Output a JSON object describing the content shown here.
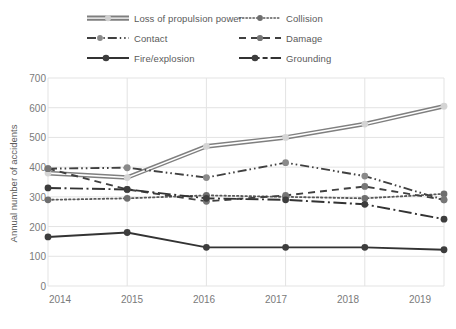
{
  "chart_data": {
    "type": "line",
    "title": "",
    "xlabel": "",
    "ylabel": "Annual number of accidents",
    "categories": [
      "2014",
      "2015",
      "2016",
      "2017",
      "2018",
      "2019"
    ],
    "x": [
      2014,
      2015,
      2016,
      2017,
      2018,
      2019
    ],
    "ylim": [
      0,
      700
    ],
    "ytick_step": 100,
    "yticks": [
      "0",
      "100",
      "200",
      "300",
      "400",
      "500",
      "600",
      "700"
    ],
    "grid": "both",
    "legend_position": "top",
    "legend_columns": 2,
    "series": [
      {
        "name": "Loss of propulsion power",
        "values": [
          380,
          365,
          470,
          500,
          545,
          605
        ],
        "style": "double-solid",
        "color": "#7f7f7f",
        "marker": "circle"
      },
      {
        "name": "Collision",
        "values": [
          290,
          295,
          305,
          300,
          295,
          310
        ],
        "style": "dotted",
        "color": "#595959",
        "marker": "circle"
      },
      {
        "name": "Contact",
        "values": [
          395,
          398,
          365,
          415,
          370,
          290
        ],
        "style": "dash-dot-dot",
        "color": "#404040",
        "marker": "circle"
      },
      {
        "name": "Damage",
        "values": [
          395,
          325,
          285,
          305,
          335,
          290
        ],
        "style": "dashed",
        "color": "#404040",
        "marker": "circle"
      },
      {
        "name": "Fire/explosion",
        "values": [
          165,
          180,
          130,
          130,
          130,
          122
        ],
        "style": "solid",
        "color": "#333333",
        "marker": "circle"
      },
      {
        "name": "Grounding",
        "values": [
          330,
          325,
          295,
          290,
          275,
          225
        ],
        "style": "dash-dot",
        "color": "#333333",
        "marker": "circle"
      }
    ]
  },
  "legend": {
    "items": [
      {
        "label": "Loss of propulsion power"
      },
      {
        "label": "Collision"
      },
      {
        "label": "Contact"
      },
      {
        "label": "Damage"
      },
      {
        "label": "Fire/explosion"
      },
      {
        "label": "Grounding"
      }
    ]
  },
  "axes": {
    "y_title": "Annual number of accidents",
    "y_ticks": [
      "700",
      "600",
      "500",
      "400",
      "300",
      "200",
      "100",
      "0"
    ],
    "x_ticks": [
      "2014",
      "2015",
      "2016",
      "2017",
      "2018",
      "2019"
    ]
  },
  "colors": {
    "grid": "#e3e3e3",
    "text": "#7a7a7a",
    "axis": "#d9d9d9",
    "background": "#ffffff"
  }
}
